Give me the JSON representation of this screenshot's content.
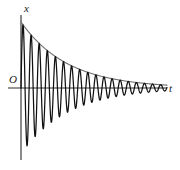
{
  "figure": {
    "name": "damped-oscillation-graph",
    "background": "#ffffff",
    "width": 180,
    "height": 170
  },
  "labels": {
    "y_axis": "x",
    "x_axis": "t",
    "origin": "O"
  },
  "colors": {
    "curve": "#111111",
    "envelope": "#6e6e6e",
    "axis": "#2b2b2b",
    "text": "#1a1a1a",
    "background": "#ffffff"
  },
  "chart_data": {
    "type": "line",
    "title": "",
    "subtitle": "",
    "xlabel": "t",
    "ylabel": "x",
    "grid": false,
    "legend": null,
    "annotations": [
      "O"
    ],
    "model": {
      "equation": "x(t) = A0 * e^(-b t) * sin(2*pi*t/T)",
      "envelope_equation": "x = A0 * e^(-b t)",
      "A0": 66,
      "decay_b": 0.0215,
      "period_T": 8.1,
      "phase": 0
    },
    "axes": {
      "origin_px": {
        "x": 21,
        "y": 88
      },
      "y_axis_top_px": 15,
      "y_axis_bottom_px": 160,
      "x_axis_left_px": 8,
      "x_axis_right_px": 167,
      "xlim": [
        0,
        146
      ],
      "ylim": [
        -70,
        70
      ]
    },
    "oscillation_count": 18,
    "t": [
      0,
      2,
      4,
      6,
      8,
      10,
      12,
      14,
      16,
      18,
      20,
      22,
      24,
      26,
      28,
      30,
      32,
      34,
      36,
      38,
      40,
      42,
      44,
      46,
      48,
      50,
      52,
      54,
      56,
      58,
      60,
      62,
      64,
      66,
      68,
      70,
      72,
      74,
      76,
      78,
      80,
      82,
      84,
      86,
      88,
      90,
      92,
      94,
      96,
      98,
      100,
      102,
      104,
      106,
      108,
      110,
      112,
      114,
      116,
      118,
      120,
      122,
      124,
      126,
      128,
      130,
      132,
      134,
      136,
      138,
      140,
      142,
      144,
      146
    ],
    "peaks": {
      "t": [
        2.0,
        10.1,
        18.2,
        26.3,
        34.4,
        42.5,
        50.6,
        58.7,
        66.8,
        74.9,
        83.0,
        91.1,
        99.2,
        107.3,
        115.4,
        123.5,
        131.6,
        139.7
      ],
      "x": [
        63.2,
        53.1,
        44.6,
        37.4,
        31.4,
        26.4,
        22.2,
        18.6,
        15.6,
        13.1,
        11.0,
        9.3,
        7.8,
        6.5,
        5.5,
        4.6,
        3.9,
        3.3
      ]
    },
    "troughs": {
      "t": [
        6.1,
        14.2,
        22.3,
        30.4,
        38.5,
        46.6,
        54.7,
        62.8,
        70.9,
        79.0,
        87.1,
        95.2,
        103.3,
        111.4,
        119.5,
        127.6,
        135.7,
        143.8
      ],
      "x": [
        -58.0,
        -48.7,
        -40.9,
        -34.3,
        -28.8,
        -24.2,
        -20.3,
        -17.1,
        -14.3,
        -12.0,
        -10.1,
        -8.5,
        -7.1,
        -6.0,
        -5.0,
        -4.2,
        -3.5,
        -3.0
      ]
    },
    "envelope_upper": {
      "t": [
        0,
        10,
        20,
        30,
        40,
        50,
        60,
        70,
        80,
        90,
        100,
        110,
        120,
        130,
        140,
        146
      ],
      "x": [
        66.0,
        53.2,
        42.9,
        34.6,
        27.9,
        22.5,
        18.1,
        14.6,
        11.8,
        9.5,
        7.7,
        6.2,
        5.0,
        4.0,
        3.2,
        2.8
      ]
    }
  }
}
